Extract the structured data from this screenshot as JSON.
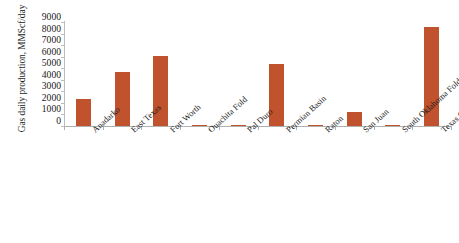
{
  "chart_data": {
    "type": "bar",
    "title": "",
    "subtitle": "",
    "xlabel": "",
    "ylabel": "Gas daily production, MMScf/day",
    "ylim": [
      0,
      9000
    ],
    "ytick_step": 1000,
    "yticks": [
      9000,
      8000,
      7000,
      6000,
      5000,
      4000,
      3000,
      2000,
      1000,
      0
    ],
    "ytick_labels": [
      "9000",
      "8000",
      "7000",
      "6000",
      "5000",
      "4000",
      "3000",
      "2000",
      "1000",
      "0"
    ],
    "grid": false,
    "legend": false,
    "legend_position": "none",
    "bar_color": "#c0522d",
    "axis_color": "#b0b0b0",
    "categories": [
      "Anadarko",
      "East Texas",
      "Fort Worth",
      "Ouachita Fold",
      "Pal Duro",
      "Permian Basin",
      "Raton",
      "San Juan",
      "South Oklahoma Folded Belt",
      "Texas Coast Basin"
    ],
    "values": [
      2350,
      4700,
      6100,
      90,
      20,
      5400,
      30,
      1200,
      40,
      8600
    ],
    "series": [
      {
        "name": "Gas daily production",
        "values": [
          2350,
          4700,
          6100,
          90,
          20,
          5400,
          30,
          1200,
          40,
          8600
        ]
      }
    ]
  },
  "axis": {
    "y_title": "Gas daily production, MMScf/day"
  }
}
